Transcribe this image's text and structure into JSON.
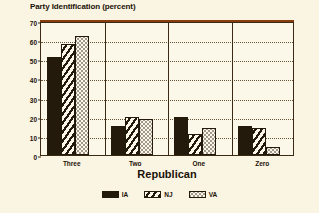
{
  "chart_data": {
    "type": "bar",
    "title": "Party Identification (percent)",
    "xlabel": "Republican",
    "ylabel": "",
    "categories": [
      "Three",
      "Two",
      "One",
      "Zero"
    ],
    "series": [
      {
        "name": "IA",
        "pattern": "solid",
        "values": [
          51,
          15,
          20,
          15
        ]
      },
      {
        "name": "NJ",
        "pattern": "hatch",
        "values": [
          58,
          20,
          11,
          14
        ]
      },
      {
        "name": "VA",
        "pattern": "dots",
        "values": [
          62,
          19,
          14,
          4
        ]
      }
    ],
    "ylim": [
      0,
      70
    ],
    "ytick_labels": [
      "0",
      "10",
      "20",
      "30",
      "40",
      "50",
      "60",
      "70"
    ],
    "ytick_values": [
      0,
      10,
      20,
      30,
      40,
      50,
      60,
      70
    ],
    "grid": true,
    "grid_axis": "y",
    "legend_position": "bottom",
    "colors": {
      "background": "#faf4e2",
      "plot_background": "#fbf7e9",
      "ink": "#241a0c",
      "frame": "#3a2a14",
      "grid": "#6a5436",
      "accent": "#8a3b10"
    }
  }
}
